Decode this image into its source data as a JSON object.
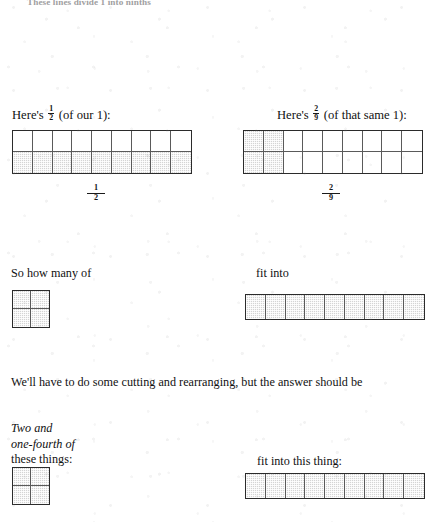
{
  "page": {
    "top_cut_line": "These lines divide 1 into ninths"
  },
  "section_half": {
    "heading_prefix": "Here's",
    "fraction": {
      "numerator": "1",
      "denominator": "2"
    },
    "heading_suffix": "(of our 1):",
    "label": {
      "numerator": "1",
      "denominator": "2"
    },
    "figure": {
      "name": "one-half-of-one-grid",
      "columns": 9,
      "rows": 2,
      "shaded_cells": 9,
      "shaded_description": "bottom row fully shaded"
    }
  },
  "section_twoninths": {
    "heading_prefix": "Here's",
    "fraction": {
      "numerator": "2",
      "denominator": "9"
    },
    "heading_suffix": "(of that same 1):",
    "label": {
      "numerator": "2",
      "denominator": "9"
    },
    "figure": {
      "name": "two-ninths-of-one-grid",
      "columns": 9,
      "rows": 2,
      "shaded_cells": 4,
      "shaded_description": "first two columns fully shaded"
    }
  },
  "section_question": {
    "left_text": "So how many of",
    "right_text": "fit into",
    "unit_figure": {
      "name": "two-ninths-unit-square",
      "columns": 2,
      "rows": 2,
      "shaded_cells": 4
    },
    "whole_figure": {
      "name": "one-half-whole-bar",
      "columns": 9,
      "rows": 1,
      "shaded_cells": 9
    }
  },
  "section_answer": {
    "intro_text": "We'll have to do some cutting and rearranging, but the answer should be",
    "left_label_lines": [
      "Two and",
      "one-fourth of",
      "these things:"
    ],
    "left_label_italic_lines": [
      "Two and",
      "one-fourth of"
    ],
    "right_label": "fit into this thing:",
    "unit_figure": {
      "name": "two-ninths-unit-square-answer",
      "columns": 2,
      "rows": 2,
      "shaded_cells": 4
    },
    "whole_figure": {
      "name": "one-half-whole-bar-answer",
      "columns": 9,
      "rows": 1,
      "shaded_cells": 9
    }
  },
  "colors": {
    "ink": "#111111",
    "rule": "#2b2b2b",
    "inner_rule": "#5a5a5a",
    "shade_fill": "#d4d4d4",
    "paper": "#ffffff",
    "faded_ink": "#9fa0a1"
  }
}
